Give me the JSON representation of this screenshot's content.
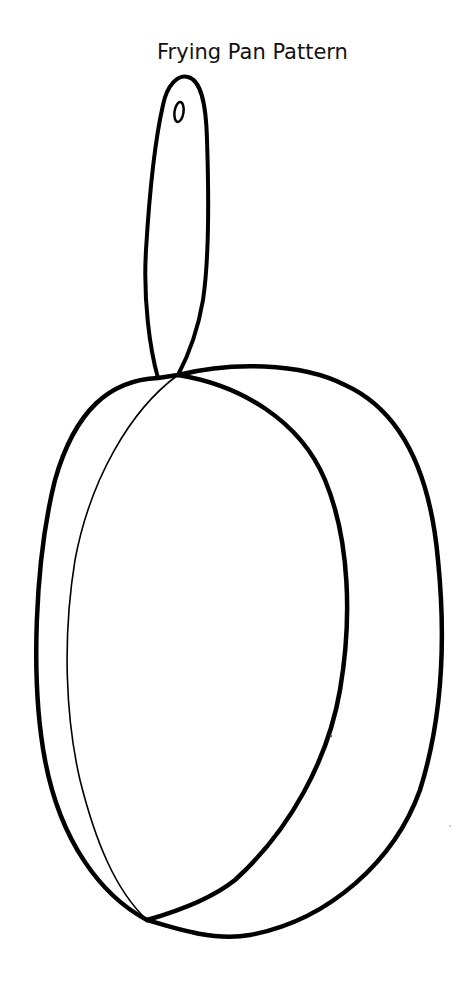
{
  "title": "Frying Pan Pattern",
  "drawing": {
    "subject": "frying-pan-outline",
    "parts": [
      "handle",
      "handle-hang-hole",
      "pan-outer-rim",
      "pan-inner-rim",
      "pan-side-line"
    ],
    "stroke_color": "#000000",
    "background_color": "#ffffff"
  }
}
